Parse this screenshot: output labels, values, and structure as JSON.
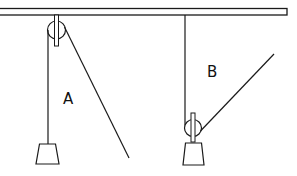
{
  "figure": {
    "colors": {
      "stroke": "#1a1a1a",
      "background": "#ffffff"
    },
    "labels": {
      "a": "A",
      "b": "B"
    },
    "systems": [
      {
        "id": "A",
        "type": "fixed-pulley",
        "label": "A"
      },
      {
        "id": "B",
        "type": "movable-pulley",
        "label": "B"
      }
    ]
  }
}
